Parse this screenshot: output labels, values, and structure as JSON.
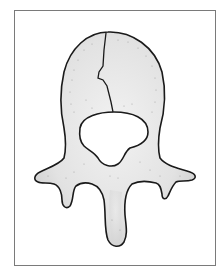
{
  "illustration": {
    "subject": "vertebra-superior-view-with-body-fracture",
    "colors": {
      "frame_border": "#7a7a7a",
      "outline": "#1a1a1a",
      "bone_fill": "#e4e4e4",
      "bone_shade": "#c9c9c9",
      "background": "#ffffff"
    }
  }
}
